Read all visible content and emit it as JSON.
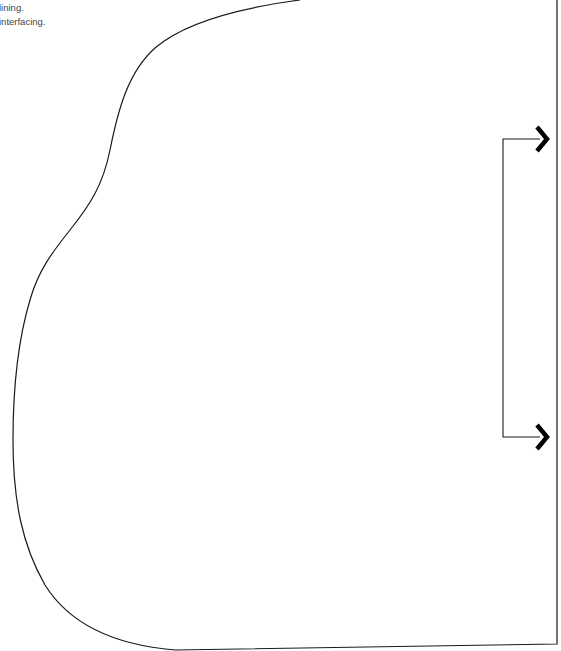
{
  "notes": [
    "lining.",
    "interfacing."
  ],
  "pattern_piece": {
    "outline_color": "#1a1a1a",
    "grainline_icon": "grainline-bracket-arrows-icon",
    "arrow_color": "#000000"
  }
}
